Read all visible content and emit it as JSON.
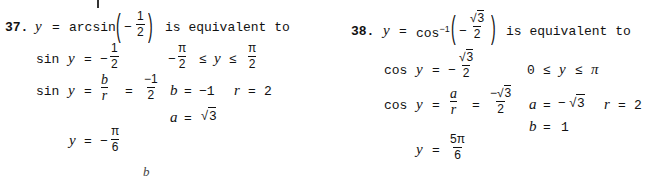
{
  "problem37": {
    "number": "37.",
    "header": {
      "lhs": "y",
      "eq": "=",
      "fn": "arcsin",
      "arg_sign": "−",
      "arg_num": "1",
      "arg_den": "2",
      "tail": "is equivalent to"
    },
    "line2": {
      "fn": "sin",
      "var": "y",
      "eq": "=",
      "sign": "−",
      "num": "1",
      "den": "2",
      "range_sign": "−",
      "range_lo_num": "π",
      "range_lo_den": "2",
      "le1": "≤",
      "range_var": "y",
      "le2": "≤",
      "range_hi_num": "π",
      "range_hi_den": "2"
    },
    "line3": {
      "fn": "sin",
      "var": "y",
      "eq": "=",
      "num": "b",
      "den": "r",
      "eq2": "=",
      "num2": "−1",
      "den2": "2",
      "b_label": "b",
      "b_eq": "=",
      "b_val": "−1",
      "r_label": "r",
      "r_eq": "=",
      "r_val": "2"
    },
    "line4": {
      "a_label": "a",
      "a_eq": "=",
      "a_val": "3"
    },
    "line5": {
      "var": "y",
      "eq": "=",
      "sign": "−",
      "num": "π",
      "den": "6"
    },
    "stray": "b"
  },
  "problem38": {
    "number": "38.",
    "header": {
      "lhs": "y",
      "eq": "=",
      "fn": "cos",
      "sup": "−1",
      "arg_sign": "−",
      "arg_num": "3",
      "arg_den": "2",
      "tail": "is equivalent to"
    },
    "line2": {
      "fn": "cos",
      "var": "y",
      "eq": "=",
      "sign": "−",
      "num": "3",
      "den": "2",
      "range_lo": "0",
      "le1": "≤",
      "range_var": "y",
      "le2": "≤",
      "range_hi": "π"
    },
    "line3": {
      "fn": "cos",
      "var": "y",
      "eq": "=",
      "num": "a",
      "den": "r",
      "eq2": "=",
      "num2_sign": "−",
      "num2": "3",
      "den2": "2",
      "a_label": "a",
      "a_eq": "=",
      "a_sign": "−",
      "a_val": "3",
      "r_label": "r",
      "r_eq": "=",
      "r_val": "2"
    },
    "line4": {
      "b_label": "b",
      "b_eq": "=",
      "b_val": "1"
    },
    "line5": {
      "var": "y",
      "eq": "=",
      "num": "5π",
      "den": "6"
    }
  }
}
